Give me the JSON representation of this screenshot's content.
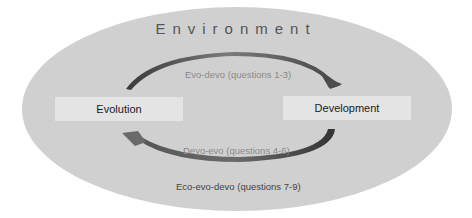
{
  "diagram": {
    "title": "Environment",
    "nodes": [
      {
        "id": "evolution",
        "label": "Evolution"
      },
      {
        "id": "development",
        "label": "Development"
      }
    ],
    "edges": [
      {
        "from": "evolution",
        "to": "development",
        "label": "Evo-devo (questions 1-3)"
      },
      {
        "from": "development",
        "to": "evolution",
        "label": "Devo-evo (questions 4-6)"
      }
    ],
    "footer_label": "Eco-evo-devo (questions 7-9)"
  },
  "colors": {
    "ellipse_fill": "#d0d0d0",
    "box_fill": "#e4e4e4",
    "arrow": "#4a4a4a",
    "edge_label": "#8a8a8a",
    "footer_label": "#444444",
    "title": "#555555"
  }
}
